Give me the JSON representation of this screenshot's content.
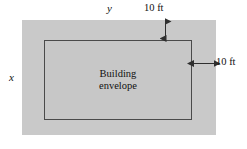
{
  "figure": {
    "type": "geometry-diagram",
    "caption_labels": {
      "lot_width_label": "y",
      "lot_height_label": "x",
      "setback_top_label": "10 ft",
      "setback_right_label": "10 ft"
    },
    "envelope": {
      "line1": "Building",
      "line2": "envelope"
    },
    "colors": {
      "lot_fill": "#c9c9c9",
      "envelope_fill": "#c7c7c7",
      "envelope_stroke": "#4a4a4a",
      "text": "#111111",
      "background": "#ffffff"
    },
    "dimensions": {
      "setback_top_ft": 10,
      "setback_right_ft": 10,
      "lot_width_variable": "y",
      "lot_height_variable": "x"
    }
  }
}
